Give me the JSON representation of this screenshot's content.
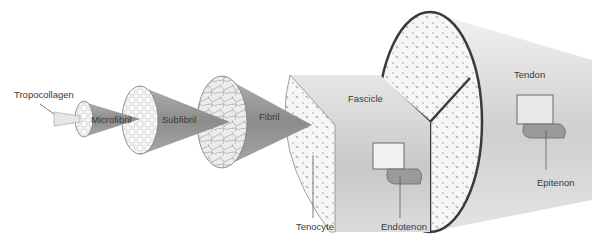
{
  "diagram": {
    "labels": {
      "tropocollagen": "Tropocollagen",
      "microfibril": "Microfibril",
      "subfibril": "Subfibril",
      "fibril": "Fibril",
      "fascicle": "Fascicle",
      "tenocyte": "Tenocyte",
      "endotenon": "Endotenon",
      "tendon": "Tendon",
      "epitenon": "Epitenon"
    },
    "order": [
      "Tropocollagen",
      "Microfibril",
      "Subfibril",
      "Fibril",
      "Fascicle",
      "Tendon"
    ],
    "colors": {
      "background": "#ffffff",
      "cone_dark": "#8a8a8a",
      "cone_light": "#d6d6d6",
      "cross_section": "#f2f2f2",
      "outline": "#4a4a4a",
      "text": "#3a3a3a"
    }
  }
}
